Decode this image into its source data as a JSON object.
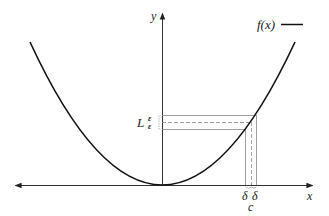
{
  "diagram": {
    "axes": {
      "x_label": "x",
      "y_label": "y"
    },
    "legend": {
      "label": "f(x)"
    },
    "labels": {
      "limit": "L",
      "epsilon_upper": "ε",
      "epsilon_lower": "ε",
      "delta_left": "δ",
      "delta_right": "δ",
      "point": "c"
    },
    "colors": {
      "curve": "#111111",
      "axes": "#333333",
      "guides": "#888888"
    }
  }
}
